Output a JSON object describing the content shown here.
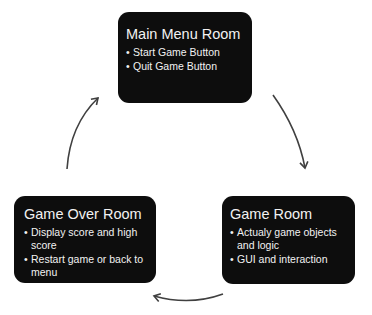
{
  "diagram": {
    "type": "cycle",
    "nodes": [
      {
        "id": "main_menu",
        "title": "Main Menu Room",
        "items": [
          "Start Game Button",
          "Quit Game Button"
        ]
      },
      {
        "id": "game",
        "title": "Game Room",
        "items": [
          "Actualy game objects and logic",
          "GUI and interaction"
        ]
      },
      {
        "id": "game_over",
        "title": "Game Over Room",
        "items": [
          "Display score and high score",
          "Restart game or back to menu"
        ]
      }
    ],
    "edges": [
      {
        "from": "main_menu",
        "to": "game"
      },
      {
        "from": "game",
        "to": "game_over"
      },
      {
        "from": "game_over",
        "to": "main_menu"
      }
    ],
    "colors": {
      "box_fill": "#0d0d0d",
      "box_text": "#f2f2f2",
      "arrow": "#404040",
      "background": "#ffffff"
    }
  }
}
